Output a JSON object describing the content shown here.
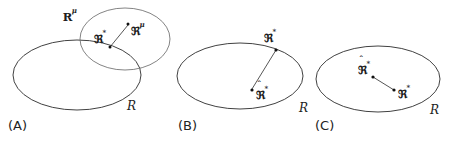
{
  "figure": {
    "name": "three-panel-region-diagram",
    "background_color": "#ffffff",
    "stroke_color": "#2b2b2b",
    "point_color": "#111111"
  },
  "panels": [
    {
      "id": "A",
      "caption": "(A)",
      "region_label": "R",
      "shapes": [
        {
          "name": "outer-region-ellipse",
          "cx": 77,
          "cy": 75,
          "rx": 64,
          "ry": 35
        },
        {
          "name": "inner-region-ellipse",
          "cx": 125,
          "cy": 39,
          "rx": 45,
          "ry": 31
        }
      ],
      "labels": [
        {
          "name": "region-mu-label",
          "text": "R",
          "sup": "μ",
          "hat": false,
          "x": 63,
          "y": 8
        },
        {
          "name": "point-star-label",
          "text": "ℜ",
          "sup": "*",
          "hat": false,
          "x": 94,
          "y": 30
        },
        {
          "name": "point-mu-label",
          "text": "ℜ",
          "sup": "μ",
          "hat": false,
          "x": 131,
          "y": 22
        },
        {
          "name": "outer-region-label",
          "text": "R",
          "sup": "",
          "hat": false,
          "x": 127,
          "y": 97
        }
      ],
      "points": [
        {
          "name": "point-star-marker",
          "x": 110,
          "y": 47
        },
        {
          "name": "point-mu-marker",
          "x": 128,
          "y": 24
        }
      ],
      "connector": {
        "name": "segment-star-to-mu",
        "x1": 110,
        "y1": 47,
        "x2": 128,
        "y2": 25
      }
    },
    {
      "id": "B",
      "caption": "(B)",
      "region_label": "R",
      "shapes": [
        {
          "name": "outer-region-ellipse",
          "cx": 240,
          "cy": 76,
          "rx": 63,
          "ry": 33
        }
      ],
      "labels": [
        {
          "name": "point-star-label",
          "text": "ℜ",
          "sup": "*",
          "hat": false,
          "x": 264,
          "y": 29
        },
        {
          "name": "point-star-hat-label",
          "text": "ℜ",
          "sup": "*",
          "hat": true,
          "x": 256,
          "y": 86
        },
        {
          "name": "outer-region-label",
          "text": "R",
          "sup": "",
          "hat": false,
          "x": 299,
          "y": 99
        }
      ],
      "points": [
        {
          "name": "point-star-marker",
          "x": 276,
          "y": 50
        },
        {
          "name": "point-star-hat-marker",
          "x": 252,
          "y": 90
        }
      ],
      "connector": {
        "name": "segment-hat-to-star",
        "x1": 252,
        "y1": 89,
        "x2": 276,
        "y2": 50
      }
    },
    {
      "id": "C",
      "caption": "(C)",
      "region_label": "R",
      "shapes": [
        {
          "name": "outer-region-ellipse",
          "cx": 378,
          "cy": 79,
          "rx": 62,
          "ry": 33
        }
      ],
      "labels": [
        {
          "name": "point-star-hat-label",
          "text": "ℜ",
          "sup": "*",
          "hat": true,
          "x": 358,
          "y": 61
        },
        {
          "name": "point-star-label",
          "text": "ℜ",
          "sup": "*",
          "hat": false,
          "x": 398,
          "y": 85
        },
        {
          "name": "outer-region-label",
          "text": "R",
          "sup": "",
          "hat": false,
          "x": 430,
          "y": 101
        }
      ],
      "points": [
        {
          "name": "point-star-hat-marker",
          "x": 373,
          "y": 77
        },
        {
          "name": "point-star-marker",
          "x": 394,
          "y": 90
        }
      ],
      "connector": {
        "name": "segment-hat-to-star",
        "x1": 373,
        "y1": 77,
        "x2": 394,
        "y2": 90
      }
    }
  ],
  "captions": {
    "a": "(A)",
    "b": "(B)",
    "c": "(C)"
  }
}
